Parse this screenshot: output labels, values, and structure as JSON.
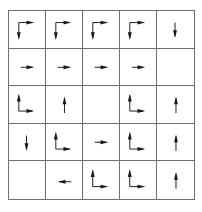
{
  "diagram": {
    "title": "",
    "rows": 5,
    "cols": 5,
    "line_color": "#6f6f6f",
    "arrow_color": "#1a1a1a",
    "cells": [
      [
        "down-right",
        "down-right",
        "down-right",
        "down-right",
        "down"
      ],
      [
        "right",
        "right",
        "right",
        "right",
        "empty"
      ],
      [
        "up-right",
        "up",
        "empty",
        "up-right",
        "up"
      ],
      [
        "down",
        "up-right",
        "right",
        "up-right",
        "up"
      ],
      [
        "empty",
        "left",
        "up-right",
        "up-right",
        "up"
      ]
    ]
  }
}
